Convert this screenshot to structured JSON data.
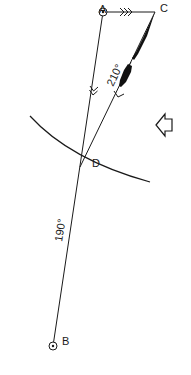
{
  "diagram": {
    "type": "navigation-plot",
    "points": {
      "A": {
        "label": "A",
        "x": 103,
        "y": 12
      },
      "B": {
        "label": "B",
        "x": 53,
        "y": 346
      },
      "C": {
        "label": "C",
        "x": 155,
        "y": 12
      },
      "D": {
        "label": "D",
        "x": 82,
        "y": 163
      }
    },
    "bearings": {
      "A_to_B": "190°",
      "C_to_D": "210°"
    },
    "icons": {
      "wind_arrow": "hollow-arrow-left-icon",
      "triple_arrow": "triple-chevron-right-icon",
      "double_arrow": "double-chevron-down-icon",
      "single_arrow": "single-chevron-down-icon",
      "fixed_position": "circle-dot-icon"
    },
    "colors": {
      "stroke": "#1a1a1a",
      "background": "#ffffff"
    }
  }
}
